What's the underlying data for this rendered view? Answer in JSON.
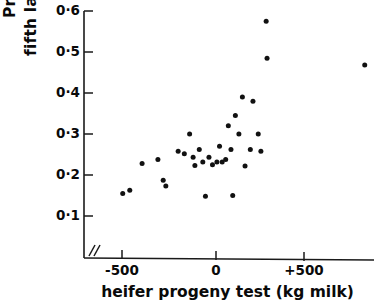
{
  "chart_data": {
    "type": "scatter",
    "title": "",
    "xlabel": "heifer progeny test (kg milk)",
    "ylabel_line1": "Proportion surviving to",
    "ylabel_line2": "fifth lactation",
    "ylabel": "Proportion surviving to fifth lactation",
    "xlim": [
      -700,
      900
    ],
    "ylim": [
      0.06,
      0.62
    ],
    "xticks": [
      -500,
      0,
      500
    ],
    "xtick_labels": [
      "-500",
      "0",
      "+500"
    ],
    "yticks": [
      0.1,
      0.2,
      0.3,
      0.4,
      0.5,
      0.6
    ],
    "ytick_labels": [
      "0·1",
      "0·2",
      "0·3",
      "0·4",
      "0·5",
      "0·6"
    ],
    "grid": false,
    "legend": "none",
    "axis_break": "//",
    "marker": "filled-circle",
    "marker_color": "#111111",
    "points": [
      {
        "x": -530,
        "y": 0.155
      },
      {
        "x": -490,
        "y": 0.163
      },
      {
        "x": -420,
        "y": 0.228
      },
      {
        "x": -330,
        "y": 0.238
      },
      {
        "x": -300,
        "y": 0.187
      },
      {
        "x": -285,
        "y": 0.173
      },
      {
        "x": -215,
        "y": 0.258
      },
      {
        "x": -180,
        "y": 0.252
      },
      {
        "x": -150,
        "y": 0.3
      },
      {
        "x": -130,
        "y": 0.243
      },
      {
        "x": -120,
        "y": 0.223
      },
      {
        "x": -95,
        "y": 0.262
      },
      {
        "x": -75,
        "y": 0.232
      },
      {
        "x": -60,
        "y": 0.148
      },
      {
        "x": -40,
        "y": 0.243
      },
      {
        "x": -20,
        "y": 0.225
      },
      {
        "x": 5,
        "y": 0.232
      },
      {
        "x": 20,
        "y": 0.27
      },
      {
        "x": 35,
        "y": 0.232
      },
      {
        "x": 55,
        "y": 0.238
      },
      {
        "x": 70,
        "y": 0.32
      },
      {
        "x": 85,
        "y": 0.262
      },
      {
        "x": 95,
        "y": 0.15
      },
      {
        "x": 110,
        "y": 0.345
      },
      {
        "x": 130,
        "y": 0.3
      },
      {
        "x": 150,
        "y": 0.39
      },
      {
        "x": 165,
        "y": 0.222
      },
      {
        "x": 195,
        "y": 0.262
      },
      {
        "x": 210,
        "y": 0.38
      },
      {
        "x": 240,
        "y": 0.3
      },
      {
        "x": 255,
        "y": 0.258
      },
      {
        "x": 285,
        "y": 0.575
      },
      {
        "x": 290,
        "y": 0.485
      },
      {
        "x": 845,
        "y": 0.468
      }
    ]
  }
}
